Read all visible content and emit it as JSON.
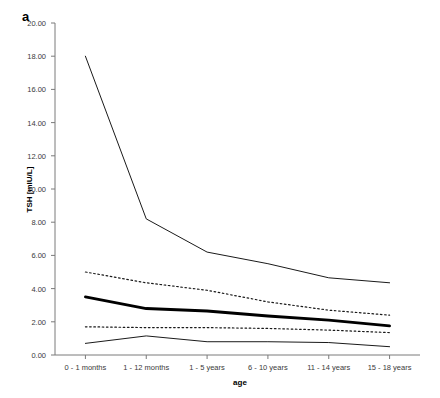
{
  "panel": {
    "label": "a"
  },
  "axes": {
    "y_title": "TSH [mIU/L]",
    "x_title": "age",
    "y_ticks": [
      "0.00",
      "2.00",
      "4.00",
      "6.00",
      "8.00",
      "10.00",
      "12.00",
      "14.00",
      "16.00",
      "18.00",
      "20.00"
    ],
    "y_min": 0.0,
    "y_max": 20.0,
    "grid": "off",
    "spines": "left-bottom"
  },
  "chart_data": {
    "type": "line",
    "title": "",
    "subtitle": "",
    "xlabel": "age",
    "ylabel": "TSH [mIU/L]",
    "ylim": [
      0.0,
      20.0
    ],
    "ytick_step": 2.0,
    "ytick_values": [
      0.0,
      2.0,
      4.0,
      6.0,
      8.0,
      10.0,
      12.0,
      14.0,
      16.0,
      18.0,
      20.0
    ],
    "grid": false,
    "legend": "none",
    "categories": [
      "0 - 1 months",
      "1 - 12 months",
      "1 - 5 years",
      "6 - 10 years",
      "11 - 14 years",
      "15 - 18 years"
    ],
    "series": [
      {
        "name": "upper reference limit (97.5th percentile)",
        "style": "solid-thin",
        "color": "#1a1a1a",
        "width": 1.0,
        "values": [
          18.0,
          8.2,
          6.2,
          5.5,
          4.65,
          4.35
        ]
      },
      {
        "name": "upper inner limit (90th percentile)",
        "style": "dotted",
        "color": "#1a1a1a",
        "width": 1.2,
        "values": [
          5.0,
          4.35,
          3.9,
          3.2,
          2.7,
          2.4
        ]
      },
      {
        "name": "median (50th percentile)",
        "style": "solid-bold",
        "color": "#000000",
        "width": 2.8,
        "values": [
          3.5,
          2.8,
          2.65,
          2.35,
          2.1,
          1.75
        ]
      },
      {
        "name": "lower inner limit (10th percentile)",
        "style": "dotted",
        "color": "#1a1a1a",
        "width": 1.2,
        "values": [
          1.7,
          1.65,
          1.65,
          1.6,
          1.5,
          1.35
        ]
      },
      {
        "name": "lower reference limit (2.5th percentile)",
        "style": "solid-thin",
        "color": "#1a1a1a",
        "width": 1.0,
        "values": [
          0.7,
          1.15,
          0.8,
          0.8,
          0.75,
          0.5
        ]
      }
    ]
  }
}
